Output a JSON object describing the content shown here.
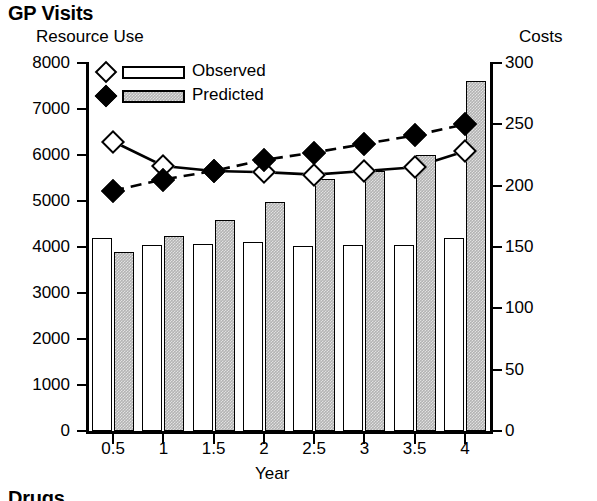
{
  "panel": {
    "title": "GP Visits",
    "next_panel_title": "Drugs"
  },
  "axes": {
    "left_title": "Resource Use",
    "right_title": "Costs",
    "x_title": "Year",
    "left_ticks": [
      "8000",
      "7000",
      "6000",
      "5000",
      "4000",
      "3000",
      "2000",
      "1000",
      "0"
    ],
    "right_ticks": [
      "300",
      "250",
      "200",
      "150",
      "100",
      "50",
      "0"
    ],
    "x_ticks": [
      "0.5",
      "1",
      "1.5",
      "2",
      "2.5",
      "3",
      "3.5",
      "4"
    ]
  },
  "legend": {
    "items": [
      {
        "label": "Observed",
        "marker": "open-diamond",
        "swatch": "white-bar"
      },
      {
        "label": "Predicted",
        "marker": "filled-diamond",
        "swatch": "gray-bar"
      }
    ]
  },
  "colors": {
    "observed_fill": "#ffffff",
    "predicted_fill": "#b3b3b3",
    "outline": "#000000"
  },
  "chart_data": {
    "type": "bar",
    "title": "GP Visits",
    "xlabel": "Year",
    "ylabel": "Resource Use",
    "y2label": "Costs",
    "ylim": [
      0,
      8000
    ],
    "y2lim": [
      0,
      300
    ],
    "grid": false,
    "legend_position": "top-left-inside",
    "categories": [
      "0.5",
      "1",
      "1.5",
      "2",
      "2.5",
      "3",
      "3.5",
      "4"
    ],
    "series": [
      {
        "name": "Observed",
        "chart_type": "bar",
        "axis": "left",
        "values": [
          4200,
          4050,
          4060,
          4100,
          4020,
          4040,
          4040,
          4200
        ]
      },
      {
        "name": "Predicted",
        "chart_type": "bar",
        "axis": "left",
        "values": [
          3900,
          4230,
          4590,
          4980,
          5470,
          5660,
          6010,
          7600
        ]
      },
      {
        "name": "Observed",
        "chart_type": "line",
        "axis": "right",
        "line_style": "solid",
        "marker": "open-diamond",
        "values": [
          236,
          216,
          212,
          211,
          209,
          212,
          215,
          228
        ]
      },
      {
        "name": "Predicted",
        "chart_type": "line",
        "axis": "right",
        "line_style": "dashed",
        "marker": "filled-diamond",
        "values": [
          196,
          205,
          212,
          221,
          227,
          234,
          241,
          250
        ]
      }
    ]
  }
}
